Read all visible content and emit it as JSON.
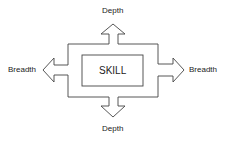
{
  "diagram": {
    "center_label": "SKILL",
    "top_label": "Depth",
    "bottom_label": "Depth",
    "left_label": "Breadth",
    "right_label": "Breadth",
    "stroke_color": "#444444"
  }
}
